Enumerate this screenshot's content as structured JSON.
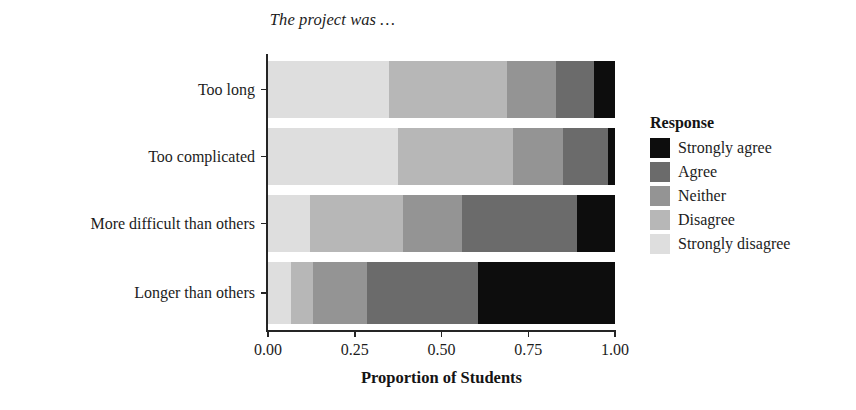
{
  "chart_data": {
    "type": "bar",
    "orientation": "horizontal",
    "stacked": true,
    "normalized": true,
    "title": "The project was …",
    "xlabel": "Proportion of Students",
    "ylabel": "",
    "xlim": [
      0.0,
      1.0
    ],
    "xticks": [
      "0.00",
      "0.25",
      "0.50",
      "0.75",
      "1.00"
    ],
    "xtick_values": [
      0.0,
      0.25,
      0.5,
      0.75,
      1.0
    ],
    "grid": false,
    "legend_title": "Response",
    "legend_position": "right",
    "categories": [
      "Too long",
      "Too complicated",
      "More difficult than others",
      "Longer than others"
    ],
    "series": [
      {
        "name": "Strongly disagree",
        "color": "#dedede",
        "values": [
          0.35,
          0.375,
          0.12,
          0.065
        ]
      },
      {
        "name": "Disagree",
        "color": "#b7b7b7",
        "values": [
          0.34,
          0.33,
          0.27,
          0.065
        ]
      },
      {
        "name": "Neither",
        "color": "#949494",
        "values": [
          0.14,
          0.145,
          0.17,
          0.155
        ]
      },
      {
        "name": "Agree",
        "color": "#6b6b6b",
        "values": [
          0.11,
          0.13,
          0.33,
          0.32
        ]
      },
      {
        "name": "Strongly agree",
        "color": "#0d0d0d",
        "values": [
          0.06,
          0.02,
          0.11,
          0.395
        ]
      }
    ],
    "legend_entries": [
      {
        "label": "Strongly agree",
        "color": "#0d0d0d"
      },
      {
        "label": "Agree",
        "color": "#6b6b6b"
      },
      {
        "label": "Neither",
        "color": "#949494"
      },
      {
        "label": "Disagree",
        "color": "#b7b7b7"
      },
      {
        "label": "Strongly disagree",
        "color": "#dedede"
      }
    ]
  },
  "layout": {
    "bar_tops": [
      61,
      128,
      195,
      262
    ],
    "bar_heights": [
      57,
      57,
      57,
      62
    ]
  }
}
